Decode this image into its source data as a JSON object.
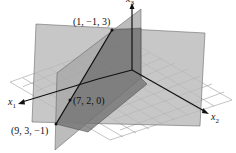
{
  "figure": {
    "axes": {
      "x1": "x",
      "x1_sub": "1",
      "x2": "x",
      "x2_sub": "2",
      "x3": "x",
      "x3_sub": "3"
    },
    "points": [
      {
        "label": "(1, −1, 3)"
      },
      {
        "label": "(7, 2, 0)"
      },
      {
        "label": "(9, 3, −1)"
      }
    ],
    "colors": {
      "plane_back": "#b9b9b9",
      "plane_vertical": "#a6a6a6",
      "plane_dark": "#6f6f6f",
      "grid": "#8a8a8a",
      "axis": "#111111"
    }
  }
}
